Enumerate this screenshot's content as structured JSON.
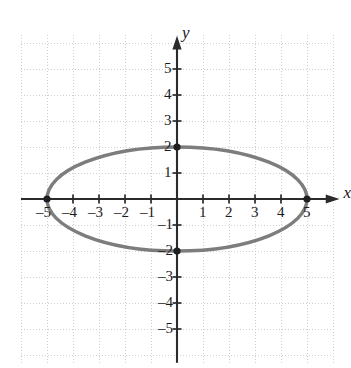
{
  "figure": {
    "kind": "coordinate-plane-graph",
    "background_color": "#ffffff"
  },
  "axes": {
    "x_axis_label": "x",
    "y_axis_label": "y",
    "axis_color": "#2b2b2b",
    "x_tick_labels": [
      "–5",
      "–4",
      "–3",
      "–2",
      "–1",
      "1",
      "2",
      "3",
      "4",
      "5"
    ],
    "x_tick_values": [
      -5,
      -4,
      -3,
      -2,
      -1,
      1,
      2,
      3,
      4,
      5
    ],
    "y_tick_labels": [
      "5",
      "4",
      "3",
      "2",
      "1",
      "–1",
      "–2",
      "–3",
      "–4",
      "–5"
    ],
    "y_tick_values": [
      5,
      4,
      3,
      2,
      1,
      -1,
      -2,
      -3,
      -4,
      -5
    ],
    "xlim": [
      -6,
      6
    ],
    "ylim": [
      -6.5,
      6.5
    ],
    "grid": true,
    "grid_color": "#cfcfcf",
    "grid_style": "dotted",
    "grid_spacing_units": 1
  },
  "chart_data": {
    "type": "scatter",
    "title": "",
    "xlabel": "x",
    "ylabel": "y",
    "xlim": [
      -6,
      6
    ],
    "ylim": [
      -6.5,
      6.5
    ],
    "grid": true,
    "legend": "none",
    "series": [
      {
        "name": "ellipse",
        "shape": "ellipse",
        "center": [
          0,
          0
        ],
        "semi_axis_x": 5,
        "semi_axis_y": 2,
        "equation": "x^2/25 + y^2/4 = 1",
        "stroke_color": "#7d7d7d",
        "stroke_width_px": 3.5,
        "fill": "none"
      },
      {
        "name": "vertices",
        "marker": "filled-circle",
        "marker_color": "#1f1f1f",
        "x": [
          -5,
          5,
          0,
          0
        ],
        "y": [
          0,
          0,
          2,
          -2
        ],
        "points": [
          [
            -5,
            0
          ],
          [
            5,
            0
          ],
          [
            0,
            2
          ],
          [
            0,
            -2
          ]
        ]
      }
    ]
  }
}
